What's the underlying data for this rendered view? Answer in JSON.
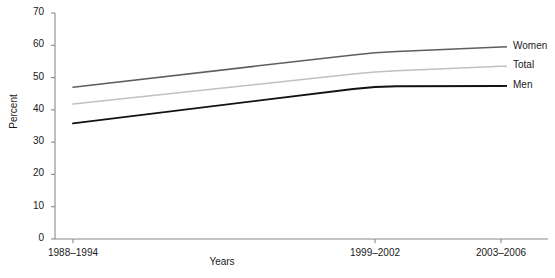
{
  "chart_data": {
    "type": "line",
    "title": "",
    "xlabel": "Years",
    "ylabel": "Percent",
    "categories": [
      "1988–1994",
      "1999–2002",
      "2003–2006"
    ],
    "ylim": [
      0,
      70
    ],
    "yticks": [
      0,
      10,
      20,
      30,
      40,
      50,
      60,
      70
    ],
    "grid": false,
    "legend_position": "right-inline",
    "series": [
      {
        "name": "Women",
        "values": [
          47.0,
          57.8,
          59.5
        ],
        "color": "#5e5e5e"
      },
      {
        "name": "Total",
        "values": [
          41.8,
          51.8,
          53.5
        ],
        "color": "#c0c0c0"
      },
      {
        "name": "Men",
        "values": [
          35.8,
          47.3,
          47.4
        ],
        "color": "#121212"
      }
    ]
  },
  "axis": {
    "y_title": "Percent",
    "x_title": "Years",
    "y_tick_labels": [
      "70",
      "60",
      "50",
      "40",
      "30",
      "20",
      "10",
      "0"
    ],
    "x_tick_labels": [
      "1988–1994",
      "1999–2002",
      "2003–2006"
    ]
  },
  "legend": {
    "items": [
      {
        "label": "Women",
        "color": "#5e5e5e"
      },
      {
        "label": "Total",
        "color": "#c0c0c0"
      },
      {
        "label": "Men",
        "color": "#121212"
      }
    ]
  },
  "colors": {
    "axis": "#8a8a8a",
    "text": "#1a1a1a",
    "background": "#ffffff"
  }
}
